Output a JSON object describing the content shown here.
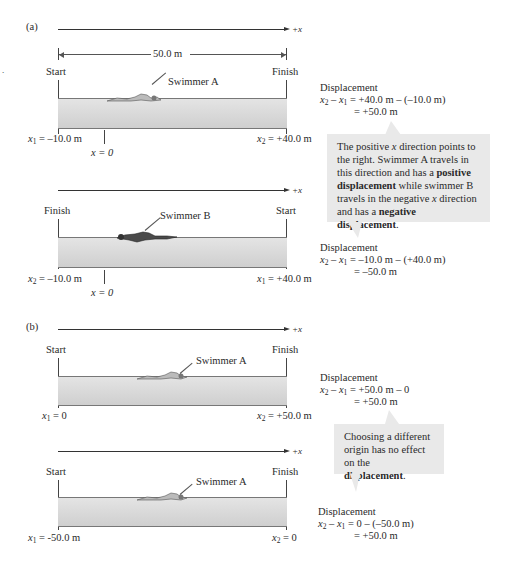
{
  "panel_a": {
    "label": "(a)",
    "axis_label": "+x",
    "top": {
      "length_label": "50.0 m",
      "left_end": "Start",
      "right_end": "Finish",
      "swimmer": "Swimmer A",
      "left_pos": {
        "var": "x",
        "sub": "1",
        "value": " = –10.0 m"
      },
      "right_pos": {
        "var": "x",
        "sub": "2",
        "value": " = +40.0 m"
      },
      "origin": "x = 0",
      "displacement": {
        "title": "Displacement",
        "line1": " = +40.0 m – (–10.0 m)",
        "line2": "= +50.0 m"
      }
    },
    "bottom": {
      "left_end": "Finish",
      "right_end": "Start",
      "swimmer": "Swimmer B",
      "left_pos": {
        "var": "x",
        "sub": "2",
        "value": " = –10.0 m"
      },
      "right_pos": {
        "var": "x",
        "sub": "1",
        "value": " = +40.0 m"
      },
      "origin": "x = 0",
      "displacement": {
        "title": "Displacement",
        "line1": " = –10.0 m – (+40.0 m)",
        "line2": "= –50.0 m"
      }
    },
    "callout": {
      "p1": "The positive ",
      "x1": "x",
      "p2": " direction points to the right. Swimmer A travels in this direction and has a ",
      "b1": "positive displacement",
      "p3": " while swimmer B travels in the negative ",
      "x2": "x",
      "p4": " direction and has a ",
      "b2": "negative displacement",
      "p5": "."
    }
  },
  "panel_b": {
    "label": "(b)",
    "axis_label": "+x",
    "top": {
      "left_end": "Start",
      "right_end": "Finish",
      "swimmer": "Swimmer A",
      "left_pos": {
        "var": "x",
        "sub": "1",
        "value": " = 0"
      },
      "right_pos": {
        "var": "x",
        "sub": "2",
        "value": " = +50.0 m"
      },
      "displacement": {
        "title": "Displacement",
        "line1": " = +50.0 m – 0",
        "line2": "= +50.0 m"
      }
    },
    "bottom": {
      "left_end": "Start",
      "right_end": "Finish",
      "swimmer": "Swimmer A",
      "left_pos": {
        "var": "x",
        "sub": "1",
        "value": " = -50.0 m"
      },
      "right_pos": {
        "var": "x",
        "sub": "2",
        "value": " = 0"
      },
      "displacement": {
        "title": "Displacement",
        "line1": " = 0 – (–50.0 m)",
        "line2": "= +50.0 m"
      }
    },
    "callout": {
      "p1": "Choosing a different origin has no effect on the ",
      "b1": "displacement",
      "p2": "."
    }
  },
  "colors": {
    "pool": "#d8d8d8",
    "callout_bg": "#e9e9e9",
    "line": "#333333"
  }
}
